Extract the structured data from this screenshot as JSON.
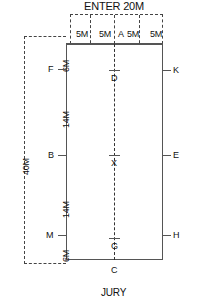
{
  "diagram": {
    "top_label": "ENTER 20M",
    "bottom_label": "JURY",
    "overall_width_label": "ENTER 20M",
    "overall_height_label": "40M",
    "segments_top": [
      {
        "label": "5M"
      },
      {
        "label": "5M"
      },
      {
        "label": "A"
      },
      {
        "label": "5M"
      },
      {
        "label": "5M"
      }
    ],
    "segments_left": [
      {
        "label": "6M"
      },
      {
        "label": "14M"
      },
      {
        "label": "14M"
      },
      {
        "label": "6M"
      }
    ],
    "markers_left": [
      {
        "label": "F"
      },
      {
        "label": "B"
      },
      {
        "label": "M"
      }
    ],
    "markers_right": [
      {
        "label": "K"
      },
      {
        "label": "E"
      },
      {
        "label": "H"
      }
    ],
    "markers_centre": [
      {
        "label": "D"
      },
      {
        "label": "X"
      },
      {
        "label": "G"
      }
    ],
    "markers_bottom": [
      {
        "label": "C"
      }
    ],
    "colors": {
      "line": "#555555",
      "dash": "#444444",
      "text": "#111111",
      "background": "#ffffff"
    }
  }
}
